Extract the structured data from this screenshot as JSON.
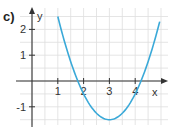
{
  "part_label": "c)",
  "colors": {
    "curve": "#3aa9d8",
    "grid": "#dedede",
    "axis": "#333333"
  },
  "chart_data": {
    "type": "line",
    "title": "",
    "xlabel": "x",
    "ylabel": "y",
    "xlim": [
      -0.5,
      5.2
    ],
    "ylim": [
      -1.7,
      2.8
    ],
    "x_ticks": [
      1,
      2,
      3,
      4
    ],
    "x_tick_labels": [
      "1",
      "2",
      "3",
      "4"
    ],
    "y_ticks": [
      -1,
      1,
      2
    ],
    "y_tick_labels": [
      "-1",
      "1",
      "2"
    ],
    "grid": true,
    "grid_step": 0.5,
    "series": [
      {
        "name": "parabola",
        "function": "y = (x - 3)^2 - 1.5",
        "vertex": [
          3,
          -1.5
        ],
        "roots": [
          1.78,
          4.22
        ],
        "x_range": [
          1.0,
          4.95
        ],
        "x": [
          1.0,
          1.5,
          2.0,
          2.5,
          3.0,
          3.5,
          4.0,
          4.5,
          4.95
        ],
        "values": [
          2.5,
          0.75,
          -0.5,
          -1.25,
          -1.5,
          -1.25,
          -0.5,
          0.75,
          2.3
        ]
      }
    ]
  }
}
